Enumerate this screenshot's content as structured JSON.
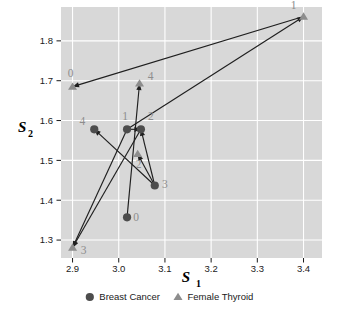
{
  "chart_data": {
    "type": "scatter",
    "title": "",
    "xlabel": "S1",
    "ylabel": "S2",
    "xlim": [
      2.875,
      3.44
    ],
    "ylim": [
      1.255,
      1.885
    ],
    "xticks": [
      "2.9",
      "3.0",
      "3.1",
      "3.2",
      "3.3",
      "3.4"
    ],
    "xtick_values": [
      2.9,
      3.0,
      3.1,
      3.2,
      3.3,
      3.4
    ],
    "yticks": [
      "1.3",
      "1.4",
      "1.5",
      "1.6",
      "1.7",
      "1.8"
    ],
    "ytick_values": [
      1.3,
      1.4,
      1.5,
      1.6,
      1.7,
      1.8
    ],
    "grid": true,
    "panel_background": "#d8d8d8",
    "gridline_color": "#ffffff",
    "legend_position": "bottom",
    "legend": [
      {
        "name": "Breast Cancer",
        "marker": "circle",
        "color": "#4d4d4d"
      },
      {
        "name": "Female Thyroid",
        "marker": "triangle",
        "color": "#8d8d8d"
      }
    ],
    "series": [
      {
        "name": "Breast Cancer",
        "marker": "circle",
        "color": "#4d4d4d",
        "points": [
          {
            "label": "0",
            "x": 3.018,
            "y": 1.357,
            "label_dx": 9,
            "label_dy": 4
          },
          {
            "label": "1",
            "x": 3.018,
            "y": 1.578,
            "label_dx": -2,
            "label_dy": -9
          },
          {
            "label": "2",
            "x": 3.048,
            "y": 1.578,
            "label_dx": 10,
            "label_dy": -9
          },
          {
            "label": "3",
            "x": 3.078,
            "y": 1.437,
            "label_dx": 10,
            "label_dy": 3
          },
          {
            "label": "4",
            "x": 2.947,
            "y": 1.578,
            "label_dx": -12,
            "label_dy": -4
          }
        ]
      },
      {
        "name": "Female Thyroid",
        "marker": "triangle",
        "color": "#8d8d8d",
        "points": [
          {
            "label": "0",
            "x": 2.9,
            "y": 1.685,
            "label_dx": -2,
            "label_dy": -10
          },
          {
            "label": "1",
            "x": 3.4,
            "y": 1.861,
            "label_dx": -10,
            "label_dy": -8
          },
          {
            "label": "2",
            "x": 3.041,
            "y": 1.516,
            "label_dx": 1,
            "label_dy": 14
          },
          {
            "label": "3",
            "x": 2.9,
            "y": 1.281,
            "label_dx": 11,
            "label_dy": 6
          },
          {
            "label": "4",
            "x": 3.045,
            "y": 1.693,
            "label_dx": 11,
            "label_dy": -3
          }
        ]
      }
    ],
    "arrows": [
      {
        "name": "arrow-0",
        "from": {
          "x": 3.4,
          "y": 1.861
        },
        "to": {
          "x": 2.9,
          "y": 1.685
        }
      },
      {
        "name": "arrow-1",
        "from": {
          "x": 3.018,
          "y": 1.578
        },
        "to": {
          "x": 3.4,
          "y": 1.861
        }
      },
      {
        "name": "arrow-2",
        "from": {
          "x": 3.078,
          "y": 1.437
        },
        "to": {
          "x": 3.048,
          "y": 1.578
        }
      },
      {
        "name": "arrow-3",
        "from": {
          "x": 3.018,
          "y": 1.578
        },
        "to": {
          "x": 3.048,
          "y": 1.578
        }
      },
      {
        "name": "arrow-4",
        "from": {
          "x": 3.078,
          "y": 1.437
        },
        "to": {
          "x": 3.041,
          "y": 1.516
        }
      },
      {
        "name": "arrow-5",
        "from": {
          "x": 3.018,
          "y": 1.357
        },
        "to": {
          "x": 3.045,
          "y": 1.693
        }
      },
      {
        "name": "arrow-6",
        "from": {
          "x": 3.048,
          "y": 1.578
        },
        "to": {
          "x": 2.9,
          "y": 1.281
        }
      },
      {
        "name": "arrow-7",
        "from": {
          "x": 3.018,
          "y": 1.578
        },
        "to": {
          "x": 2.9,
          "y": 1.281
        }
      },
      {
        "name": "arrow-8",
        "from": {
          "x": 3.078,
          "y": 1.437
        },
        "to": {
          "x": 2.947,
          "y": 1.578
        }
      }
    ]
  },
  "plot": {
    "panel": {
      "left": 61,
      "top": 7,
      "right": 322,
      "bottom": 258
    },
    "marker_radius": 4.1,
    "triangle_size": 9.0,
    "arrow_color": "#1f1f1f",
    "arrow_width": 1.15
  }
}
